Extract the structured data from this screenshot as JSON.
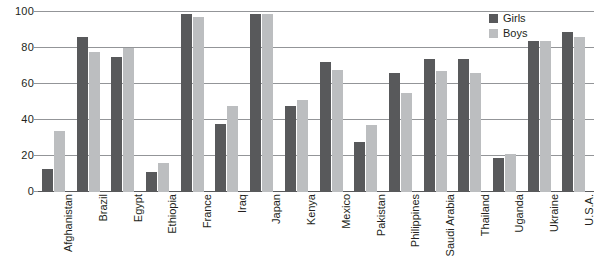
{
  "chart_data": {
    "type": "bar",
    "title": "",
    "subtitle": "",
    "xlabel": "",
    "ylabel": "",
    "ylim": [
      0,
      100
    ],
    "yticks": [
      0,
      20,
      40,
      60,
      80,
      100
    ],
    "grid": true,
    "legend_position": "top-right",
    "categories": [
      "Afghanistan",
      "Brazil",
      "Egypt",
      "Ethiopia",
      "France",
      "Iraq",
      "Japan",
      "Kenya",
      "Mexico",
      "Pakistan",
      "Philippines",
      "Saudi Arabia",
      "Thailand",
      "Uganda",
      "Ukraine",
      "U.S.A."
    ],
    "series": [
      {
        "name": "Girls",
        "color": "#58595b",
        "values": [
          13,
          86,
          75,
          11,
          99,
          38,
          99,
          48,
          72,
          28,
          66,
          74,
          74,
          19,
          84,
          89
        ]
      },
      {
        "name": "Boys",
        "color": "#bcbec0",
        "values": [
          34,
          78,
          80,
          16,
          97,
          48,
          99,
          51,
          68,
          37,
          55,
          67,
          66,
          21,
          84,
          86
        ]
      }
    ]
  },
  "legend": {
    "items": [
      {
        "label": "Girls",
        "color": "#58595b"
      },
      {
        "label": "Boys",
        "color": "#bcbec0"
      }
    ]
  },
  "axis": {
    "y_tick_labels": [
      "100",
      "80",
      "60",
      "40",
      "20",
      "0"
    ]
  }
}
